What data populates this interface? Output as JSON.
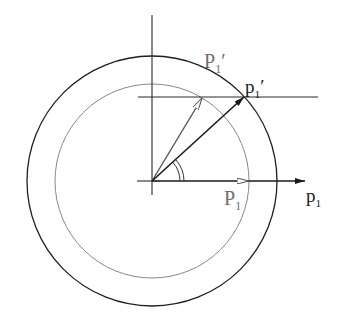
{
  "diagram": {
    "type": "vector-rotation-circles",
    "colors": {
      "background": "#ffffff",
      "dark": "#1a1a1a",
      "grey": "#777777"
    },
    "labels": {
      "P1_prime": {
        "base": "P",
        "sub": "1",
        "prime": "′"
      },
      "p1_prime": {
        "base": "p",
        "sub": "1",
        "prime": "′"
      },
      "P1": {
        "base": "P",
        "sub": "1"
      },
      "p1": {
        "base": "p",
        "sub": "1"
      }
    },
    "geometry": {
      "origin": [
        152,
        181
      ],
      "outer_circle_radius": 125,
      "inner_circle_radius": 97,
      "horizontal_line_y": 97,
      "grey_arrow_tip": [
        202,
        98
      ],
      "black_arrow_tip": [
        244,
        97
      ],
      "P1_arrow_tip": [
        249,
        181
      ],
      "p1_arrow_tip": [
        305,
        181
      ]
    }
  }
}
